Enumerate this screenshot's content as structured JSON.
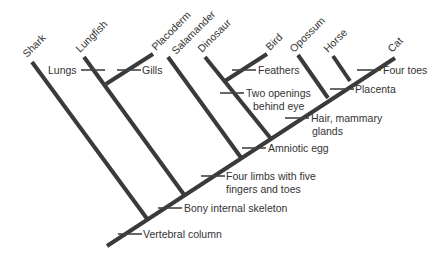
{
  "diagram": {
    "type": "cladogram",
    "taxa": [
      "Shark",
      "Lungfish",
      "Placoderm",
      "Salamander",
      "Dinosaur",
      "Bird",
      "Opossum",
      "Horse",
      "Cat"
    ],
    "characters": {
      "lungs": "Lungs",
      "gills": "Gills",
      "feathers": "Feathers",
      "two_openings_1": "Two openings",
      "two_openings_2": "behind eye",
      "four_toes": "Four toes",
      "placenta": "Placenta",
      "hair_1": "Hair, mammary",
      "hair_2": "glands",
      "amniotic": "Amniotic egg",
      "limbs_1": "Four limbs with five",
      "limbs_2": "fingers and toes",
      "bony": "Bony internal skeleton",
      "vertebral": "Vertebral column"
    }
  }
}
